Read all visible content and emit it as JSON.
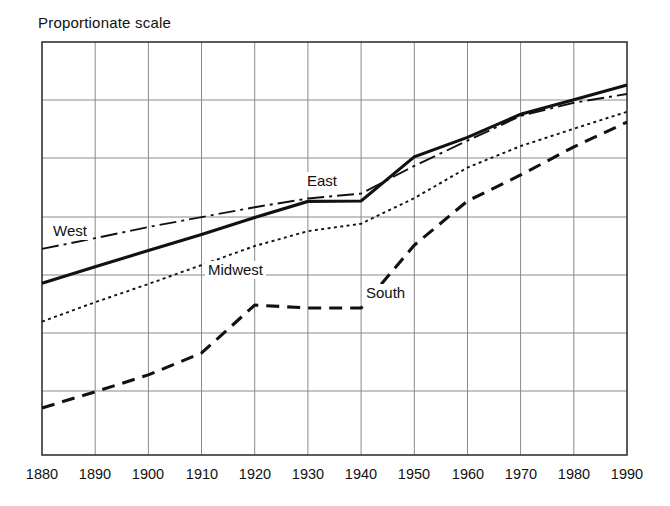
{
  "chart_data": {
    "type": "line",
    "title": "Proportionate scale",
    "xlabel": "",
    "ylabel": "",
    "grid": true,
    "legend_position": "inline-labels",
    "x": [
      1880,
      1890,
      1900,
      1910,
      1920,
      1930,
      1940,
      1950,
      1960,
      1970,
      1980,
      1990
    ],
    "xticklabels": [
      "1880",
      "1890",
      "1900",
      "1910",
      "1920",
      "1930",
      "1940",
      "1950",
      "1960",
      "1970",
      "1980",
      "1990"
    ],
    "xlim": [
      1880,
      1990
    ],
    "ylim": [
      0,
      100
    ],
    "yticklabels": [],
    "y_gridline_count": 7,
    "axis_note": "Proportionate (ratio) vertical scale, unlabeled",
    "series": [
      {
        "name": "East",
        "style": "solid",
        "linewidth": "thick",
        "color": "#111111",
        "label_x": 1930,
        "values": [
          41.6,
          45.6,
          49.5,
          53.4,
          57.5,
          61.4,
          61.5,
          72.2,
          76.9,
          82.5,
          86.0,
          89.6
        ]
      },
      {
        "name": "West",
        "style": "dashdot",
        "linewidth": "thin",
        "color": "#111111",
        "label_x": 1880,
        "values": [
          49.9,
          52.5,
          55.2,
          57.6,
          60.0,
          62.1,
          63.3,
          70.0,
          76.1,
          82.1,
          85.3,
          87.4
        ]
      },
      {
        "name": "Midwest",
        "style": "dotted",
        "linewidth": "thin",
        "color": "#111111",
        "label_x": 1910,
        "values": [
          32.3,
          37.0,
          41.4,
          46.0,
          50.6,
          54.2,
          56.0,
          62.2,
          69.6,
          74.8,
          79.0,
          83.1
        ]
      },
      {
        "name": "South",
        "style": "dashed",
        "linewidth": "thick",
        "color": "#111111",
        "label_x": 1940,
        "values": [
          11.4,
          15.3,
          19.4,
          24.7,
          36.3,
          35.6,
          35.6,
          50.8,
          61.5,
          67.8,
          74.6,
          80.6
        ]
      }
    ]
  },
  "labels": {
    "east": "East",
    "west": "West",
    "midwest": "Midwest",
    "south": "South"
  }
}
